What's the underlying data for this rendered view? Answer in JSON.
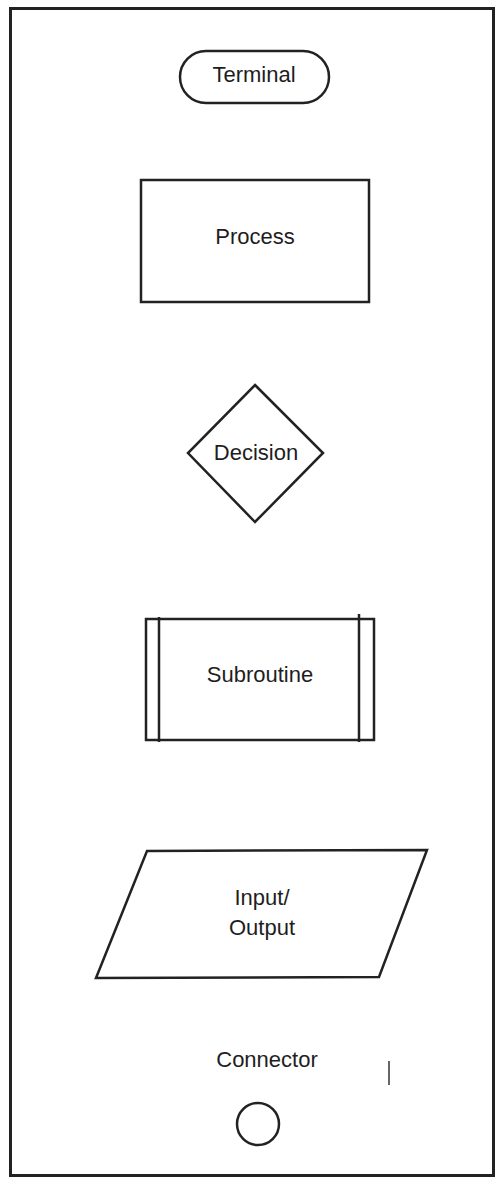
{
  "diagram": {
    "stroke_color": "#222222",
    "symbols": [
      {
        "id": "terminal",
        "label": "Terminal",
        "shape": "rounded-rectangle"
      },
      {
        "id": "process",
        "label": "Process",
        "shape": "rectangle"
      },
      {
        "id": "decision",
        "label": "Decision",
        "shape": "diamond"
      },
      {
        "id": "subroutine",
        "label": "Subroutine",
        "shape": "predefined-process"
      },
      {
        "id": "input-output",
        "label_line1": "Input/",
        "label_line2": "Output",
        "shape": "parallelogram"
      },
      {
        "id": "connector",
        "label": "Connector",
        "shape": "circle"
      }
    ]
  }
}
